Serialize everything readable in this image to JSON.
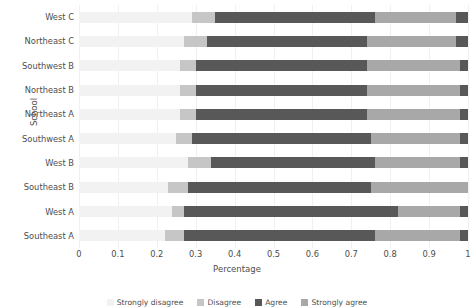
{
  "chart_data": {
    "type": "bar",
    "orientation": "horizontal",
    "stacked": true,
    "title": "",
    "xlabel": "Percentage",
    "ylabel": "School",
    "xlim": [
      0,
      1
    ],
    "xticks": [
      "0",
      "0.1",
      "0.2",
      "0.3",
      "0.4",
      "0.5",
      "0.6",
      "0.7",
      "0.8",
      "0.9",
      "1"
    ],
    "xtick_values": [
      0,
      0.1,
      0.2,
      0.3,
      0.4,
      0.5,
      0.6,
      0.7,
      0.8,
      0.9,
      1
    ],
    "grid": true,
    "grid_axis": "x",
    "legend_position": "bottom",
    "categories": [
      "West C",
      "Northeast C",
      "Southwest B",
      "Northeast B",
      "Northeast A",
      "Southwest A",
      "West B",
      "Southeast B",
      "West A",
      "Southeast A"
    ],
    "series": [
      {
        "name": "Strongly disagree",
        "color": "#f2f2f2",
        "values": [
          0.29,
          0.27,
          0.26,
          0.26,
          0.26,
          0.25,
          0.28,
          0.23,
          0.24,
          0.22
        ]
      },
      {
        "name": "Disagree",
        "color": "#c6c6c6",
        "values": [
          0.06,
          0.06,
          0.04,
          0.04,
          0.04,
          0.04,
          0.06,
          0.05,
          0.03,
          0.05
        ]
      },
      {
        "name": "Agree",
        "color": "#585858",
        "values": [
          0.41,
          0.41,
          0.44,
          0.44,
          0.44,
          0.46,
          0.42,
          0.47,
          0.55,
          0.49
        ]
      },
      {
        "name": "Strongly agree",
        "color": "#a8a8a8",
        "values": [
          0.21,
          0.23,
          0.24,
          0.24,
          0.24,
          0.23,
          0.22,
          0.25,
          0.16,
          0.22
        ]
      },
      {
        "name": "No response",
        "color": "#585858",
        "values": [
          0.03,
          0.03,
          0.02,
          0.02,
          0.02,
          0.02,
          0.02,
          0.0,
          0.02,
          0.02
        ]
      }
    ]
  },
  "axes": {
    "x_title": "Percentage",
    "y_title": "School"
  }
}
